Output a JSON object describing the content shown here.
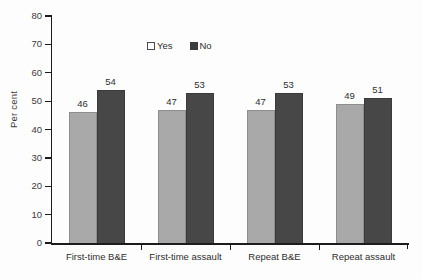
{
  "chart_data": {
    "type": "bar",
    "title": "",
    "subtitle": "",
    "xlabel": "",
    "ylabel": "Per cent",
    "ylim": [
      0,
      80
    ],
    "ytick_step": 10,
    "yticks": [
      0,
      10,
      20,
      30,
      40,
      50,
      60,
      70,
      80
    ],
    "grid": false,
    "legend_position": "top-center",
    "categories": [
      "First-time B&E",
      "First-time assault",
      "Repeat B&E",
      "Repeat assault"
    ],
    "series": [
      {
        "name": "Yes",
        "color": "#a9a9a9",
        "values": [
          46,
          47,
          47,
          49
        ]
      },
      {
        "name": "No",
        "color": "#474747",
        "values": [
          54,
          53,
          53,
          51
        ]
      }
    ],
    "data_labels": [
      {
        "category": "First-time B&E",
        "series": "Yes",
        "value": 46
      },
      {
        "category": "First-time B&E",
        "series": "No",
        "value": 54
      },
      {
        "category": "First-time assault",
        "series": "Yes",
        "value": 47
      },
      {
        "category": "First-time assault",
        "series": "No",
        "value": 53
      },
      {
        "category": "Repeat B&E",
        "series": "Yes",
        "value": 47
      },
      {
        "category": "Repeat B&E",
        "series": "No",
        "value": 53
      },
      {
        "category": "Repeat assault",
        "series": "Yes",
        "value": 49
      },
      {
        "category": "Repeat assault",
        "series": "No",
        "value": 51
      }
    ]
  },
  "axis": {
    "y_title": "Per cent",
    "y_ticks": [
      "0",
      "10",
      "20",
      "30",
      "40",
      "50",
      "60",
      "70",
      "80"
    ]
  },
  "legend": {
    "items": [
      {
        "label": "Yes",
        "swatch": "legend-swatch-light"
      },
      {
        "label": "No",
        "swatch": "legend-swatch-dark"
      }
    ]
  },
  "bars": [
    {
      "label": "46"
    },
    {
      "label": "54"
    },
    {
      "label": "47"
    },
    {
      "label": "53"
    },
    {
      "label": "47"
    },
    {
      "label": "53"
    },
    {
      "label": "49"
    },
    {
      "label": "51"
    }
  ],
  "categories": [
    {
      "label": "First-time B&E"
    },
    {
      "label": "First-time assault"
    },
    {
      "label": "Repeat B&E"
    },
    {
      "label": "Repeat assault"
    }
  ]
}
